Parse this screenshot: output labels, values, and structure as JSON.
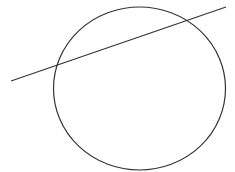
{
  "diagram": {
    "type": "geometry",
    "background": "#ffffff",
    "stroke_color": "#333333",
    "circle": {
      "cx": 139.5,
      "cy": 88.5,
      "rx": 86,
      "ry": 81.5,
      "stroke_width": 1.2
    },
    "line": {
      "x1": 11,
      "y1": 81,
      "x2": 226,
      "y2": 7,
      "stroke_width": 1.2
    }
  }
}
